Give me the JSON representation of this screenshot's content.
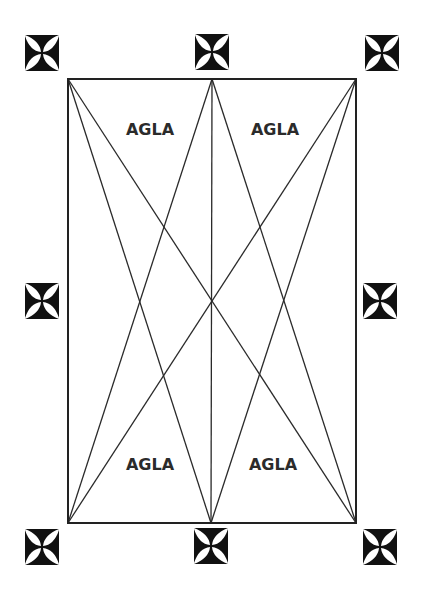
{
  "diagram": {
    "title": "",
    "frame": {
      "x": 68,
      "y": 79,
      "width": 288,
      "height": 444
    },
    "points": {
      "top_left": [
        68,
        79
      ],
      "top_middle": [
        212,
        79
      ],
      "top_right": [
        356,
        79
      ],
      "bottom_left": [
        68,
        523
      ],
      "bottom_middle": [
        211,
        523
      ],
      "bottom_right": [
        356,
        523
      ]
    },
    "lines": [
      {
        "name": "diagonal-tl-br",
        "from": "top_left",
        "to": "bottom_right"
      },
      {
        "name": "diagonal-tr-bl",
        "from": "top_right",
        "to": "bottom_left"
      },
      {
        "name": "line-tl-bm",
        "from": "top_left",
        "to": "bottom_middle"
      },
      {
        "name": "line-tr-bm",
        "from": "top_right",
        "to": "bottom_middle"
      },
      {
        "name": "line-tm-bl",
        "from": "top_middle",
        "to": "bottom_left"
      },
      {
        "name": "line-tm-br",
        "from": "top_middle",
        "to": "bottom_right"
      },
      {
        "name": "line-vertical-center",
        "from": "top_middle",
        "to": "bottom_middle"
      }
    ],
    "labels": [
      {
        "name": "label-top-left",
        "text": "AGLA",
        "x": 150,
        "y": 135
      },
      {
        "name": "label-top-right",
        "text": "AGLA",
        "x": 275,
        "y": 135
      },
      {
        "name": "label-bottom-left",
        "text": "AGLA",
        "x": 150,
        "y": 470
      },
      {
        "name": "label-bottom-right",
        "text": "AGLA",
        "x": 273,
        "y": 470
      }
    ],
    "crosses": [
      {
        "name": "cross-top-left",
        "icon": "cross-pattee-icon",
        "cx": 42,
        "cy": 53
      },
      {
        "name": "cross-top-middle",
        "icon": "cross-pattee-icon",
        "cx": 212,
        "cy": 52
      },
      {
        "name": "cross-top-right",
        "icon": "cross-pattee-icon",
        "cx": 382,
        "cy": 53
      },
      {
        "name": "cross-middle-left",
        "icon": "cross-pattee-icon",
        "cx": 42,
        "cy": 301
      },
      {
        "name": "cross-middle-right",
        "icon": "cross-pattee-icon",
        "cx": 380,
        "cy": 301
      },
      {
        "name": "cross-bottom-left",
        "icon": "cross-pattee-icon",
        "cx": 42,
        "cy": 547
      },
      {
        "name": "cross-bottom-middle",
        "icon": "cross-pattee-icon",
        "cx": 211,
        "cy": 546
      },
      {
        "name": "cross-bottom-right",
        "icon": "cross-pattee-icon",
        "cx": 380,
        "cy": 547
      }
    ],
    "colors": {
      "background": "#ffffff",
      "stroke": "#2a2a2a",
      "text": "#2b2b2b",
      "cross": "#111111"
    }
  }
}
